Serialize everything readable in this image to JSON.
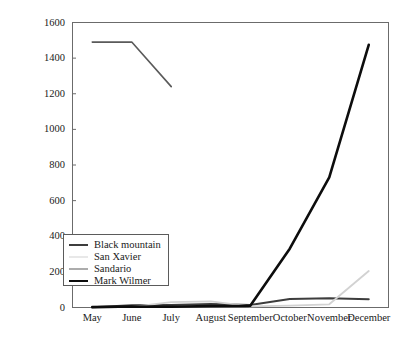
{
  "chart_data": {
    "type": "line",
    "title": "",
    "xlabel": "",
    "ylabel": "Number of settled mussels",
    "categories": [
      "May",
      "June",
      "July",
      "August",
      "September",
      "October",
      "November",
      "December"
    ],
    "ylim": [
      0,
      1600
    ],
    "yticks": [
      0,
      200,
      400,
      600,
      800,
      1000,
      1200,
      1400,
      1600
    ],
    "grid": false,
    "legend_position": "lower left",
    "series": [
      {
        "name": "Black mountain",
        "color": "#3d3d3d",
        "width": 2.0,
        "values": [
          2,
          12,
          14,
          20,
          14,
          48,
          52,
          46
        ]
      },
      {
        "name": "San Xavier",
        "color": "#d2d2d2",
        "width": 1.8,
        "values": [
          0,
          4,
          30,
          34,
          6,
          10,
          18,
          205
        ]
      },
      {
        "name": "Sandario",
        "color": "#5a5a5a",
        "width": 1.6,
        "values": [
          1490,
          1490,
          1240,
          null,
          null,
          null,
          null,
          null
        ]
      },
      {
        "name": "Mark Wilmer",
        "color": "#0d0d0d",
        "width": 2.6,
        "values": [
          2,
          6,
          4,
          8,
          10,
          330,
          730,
          1475
        ]
      }
    ]
  },
  "axis": {
    "y_tick_labels": [
      "1600",
      "1400",
      "1200",
      "1000",
      "800",
      "600",
      "400",
      "200",
      "0"
    ],
    "y_title": "Number of settled mussels",
    "x_tick_labels": [
      "May",
      "June",
      "July",
      "August",
      "September",
      "October",
      "November",
      "December"
    ]
  },
  "legend": {
    "items": [
      {
        "label": "Black mountain",
        "color": "#3d3d3d",
        "width": 2.0
      },
      {
        "label": "San Xavier",
        "color": "#d2d2d2",
        "width": 1.8
      },
      {
        "label": "Sandario",
        "color": "#5a5a5a",
        "width": 1.6
      },
      {
        "label": "Mark Wilmer",
        "color": "#0d0d0d",
        "width": 2.6
      }
    ]
  },
  "colors": {
    "frame": "#6b6b6b",
    "background": "#ffffff",
    "text": "#1a1a1a"
  }
}
